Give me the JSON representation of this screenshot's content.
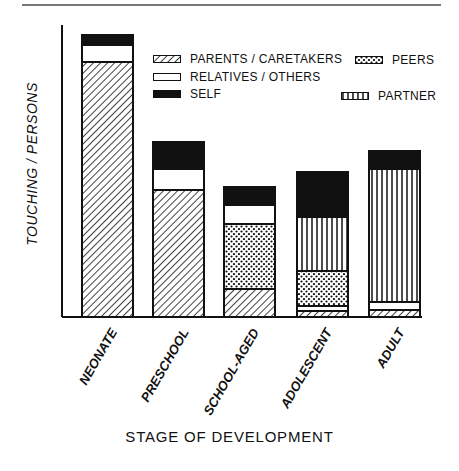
{
  "chart_data": {
    "type": "bar",
    "stacked": true,
    "title": "",
    "xlabel": "STAGE OF DEVELOPMENT",
    "ylabel": "TOUCHING / PERSONS",
    "y_units": "relative (no ticks shown; values estimated in pixel-height units)",
    "categories": [
      "NEONATE",
      "PRESCHOOL",
      "SCHOOL-AGED",
      "ADOLESCENT",
      "ADULT"
    ],
    "series": [
      {
        "name": "PARENTS / CARETAKERS",
        "pattern": "diagonal-hatch",
        "values": [
          255,
          127,
          28,
          6,
          7
        ]
      },
      {
        "name": "RELATIVES / OTHERS",
        "pattern": "white",
        "values": [
          17,
          21,
          19,
          5,
          8
        ]
      },
      {
        "name": "PEERS",
        "pattern": "dots",
        "values": [
          0,
          0,
          65,
          35,
          0
        ]
      },
      {
        "name": "PARTNER",
        "pattern": "vertical-stripes",
        "values": [
          0,
          0,
          0,
          54,
          133
        ]
      },
      {
        "name": "SELF",
        "pattern": "solid-black",
        "values": [
          10,
          27,
          18,
          45,
          18
        ]
      }
    ],
    "stack_order_bottom_to_top": {
      "NEONATE": [
        "PARENTS / CARETAKERS",
        "RELATIVES / OTHERS",
        "SELF"
      ],
      "PRESCHOOL": [
        "PARENTS / CARETAKERS",
        "RELATIVES / OTHERS",
        "SELF"
      ],
      "SCHOOL-AGED": [
        "PARENTS / CARETAKERS",
        "PEERS",
        "RELATIVES / OTHERS",
        "SELF"
      ],
      "ADOLESCENT": [
        "PARENTS / CARETAKERS",
        "RELATIVES / OTHERS",
        "PEERS",
        "PARTNER",
        "SELF"
      ],
      "ADULT": [
        "PARENTS / CARETAKERS",
        "RELATIVES / OTHERS",
        "PARTNER",
        "SELF"
      ]
    },
    "totals": [
      282,
      175,
      130,
      146,
      166
    ],
    "ylim": [
      0,
      292
    ],
    "grid": false,
    "legend_position": "upper-right inside plot",
    "legend": [
      {
        "label": "PARENTS / CARETAKERS",
        "pattern": "diagonal-hatch"
      },
      {
        "label": "RELATIVES / OTHERS",
        "pattern": "white"
      },
      {
        "label": "SELF",
        "pattern": "solid-black"
      },
      {
        "label": "PEERS",
        "pattern": "dots"
      },
      {
        "label": "PARTNER",
        "pattern": "vertical-stripes"
      }
    ]
  },
  "colors": {
    "ink": "#111111",
    "background": "#ffffff",
    "rule": "#777777"
  }
}
